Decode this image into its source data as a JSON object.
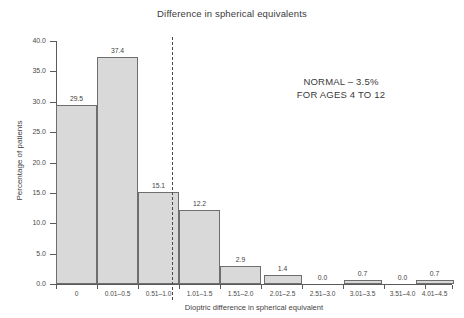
{
  "chart_data": {
    "type": "bar",
    "title": "Difference in spherical equivalents",
    "xlabel": "Dioptric difference in spherical equivalent",
    "ylabel": "Percentage of patients",
    "categories": [
      "0",
      "0.01–0.5",
      "0.51–1.0",
      "1.01–1.5",
      "1.51–2.0",
      "2.01–2.5",
      "2.51–3.0",
      "3.01–3.5",
      "3.51–4.0",
      "4.01–4.5"
    ],
    "values": [
      29.5,
      37.4,
      15.1,
      12.2,
      2.9,
      1.4,
      0.0,
      0.7,
      0.0,
      0.7
    ],
    "value_labels": [
      "29.5",
      "37.4",
      "15.1",
      "12.2",
      "2.9",
      "1.4",
      "0.0",
      "0.7",
      "0.0",
      "0.7"
    ],
    "ylim": [
      0.0,
      40.0
    ],
    "yticks": [
      0.0,
      5.0,
      10.0,
      15.0,
      20.0,
      25.0,
      30.0,
      35.0,
      40.0
    ],
    "ytick_labels": [
      "0.0",
      "5.0",
      "10.0",
      "15.0",
      "20.0",
      "25.0",
      "30.0",
      "35.0",
      "40.0"
    ],
    "grid": false,
    "legend": null,
    "bar_color": "#d9d9d9",
    "bar_edge_color": "#6e6e6e",
    "annotations": [
      {
        "name": "normal-range-note",
        "lines": [
          "NORMAL – 3.5%",
          "FOR AGES 4 TO 12"
        ]
      },
      {
        "name": "cutoff-divider",
        "description": "dashed vertical line between 0.51–1.0 and 1.01–1.5"
      }
    ]
  },
  "annotation": {
    "line1": "NORMAL – 3.5%",
    "line2": "FOR AGES 4 TO 12"
  }
}
